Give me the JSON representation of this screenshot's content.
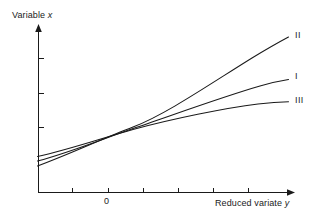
{
  "figure": {
    "background_color": "#ffffff",
    "ink_color": "#1a1a1a",
    "width": 317,
    "height": 219
  },
  "axes": {
    "y_title_prefix": "Variable ",
    "y_title_symbol": "x",
    "x_title_prefix": "Reduced variate ",
    "x_title_symbol": "y",
    "x_tick_labels": [
      "0"
    ],
    "y_tick_labels": []
  },
  "curve_labels": {
    "upper": "II",
    "middle": "I",
    "lower": "III"
  },
  "chart_data": {
    "type": "line",
    "title": "",
    "xlabel": "Reduced variate y",
    "ylabel": "Variable x",
    "grid": false,
    "legend": "inline-right-end-labels",
    "xlim": [
      -2,
      6
    ],
    "ylim": [
      0,
      1
    ],
    "x_ticks": [
      -1,
      0,
      1,
      2,
      3,
      4
    ],
    "x_tick_labels": [
      "",
      "0",
      "",
      "",
      "",
      ""
    ],
    "y_ticks": [
      0.42,
      0.63,
      0.84
    ],
    "y_tick_labels": [
      "",
      "",
      ""
    ],
    "annotations": [
      {
        "text": "II",
        "x": 6.0,
        "y": 0.925,
        "note": "upper convex curve end label"
      },
      {
        "text": "I",
        "x": 6.0,
        "y": 0.67,
        "note": "middle near-linear curve end label"
      },
      {
        "text": "III",
        "x": 6.0,
        "y": 0.535,
        "note": "lower concave curve end label"
      }
    ],
    "series": [
      {
        "name": "II",
        "shape": "convex-upward",
        "x": [
          -1.85,
          -1.3,
          -0.75,
          -0.2,
          0.35,
          0.9,
          1.45,
          2.0,
          2.6,
          3.2,
          3.8,
          4.4,
          5.0,
          5.6,
          5.85
        ],
        "y": [
          0.155,
          0.215,
          0.275,
          0.34,
          0.41,
          0.475,
          0.54,
          0.605,
          0.675,
          0.745,
          0.81,
          0.865,
          0.915,
          0.955,
          0.975
        ]
      },
      {
        "name": "I",
        "shape": "near-linear",
        "x": [
          -1.85,
          -1.3,
          -0.75,
          -0.2,
          0.35,
          0.9,
          1.45,
          2.0,
          2.6,
          3.2,
          3.8,
          4.4,
          5.0,
          5.6,
          5.85
        ],
        "y": [
          0.185,
          0.235,
          0.285,
          0.335,
          0.39,
          0.44,
          0.487,
          0.53,
          0.575,
          0.615,
          0.652,
          0.685,
          0.713,
          0.737,
          0.746
        ]
      },
      {
        "name": "III",
        "shape": "concave-flattening",
        "x": [
          -1.85,
          -1.3,
          -0.75,
          -0.2,
          0.35,
          0.9,
          1.45,
          2.0,
          2.6,
          3.2,
          3.8,
          4.4,
          5.0,
          5.6,
          5.85
        ],
        "y": [
          0.21,
          0.255,
          0.3,
          0.345,
          0.388,
          0.428,
          0.464,
          0.496,
          0.528,
          0.553,
          0.573,
          0.588,
          0.598,
          0.604,
          0.606
        ]
      }
    ]
  },
  "geometry": {
    "x_axis": {
      "x1": 38,
      "y1": 192,
      "x2": 292,
      "y2": 192
    },
    "y_axis": {
      "x1": 38,
      "y1": 192,
      "x2": 38,
      "y2": 26
    },
    "x_tick_positions": [
      72,
      108,
      143,
      178,
      213,
      248
    ],
    "y_tick_positions": [
      58,
      93,
      127
    ],
    "curve_paths": {
      "II": "M 37.5,166 C 70,154 104,138 133,127 C 165,115 210,84 252,58 C 270,47 281,41 288.5,37",
      "I": "M 37.5,161 C 70,152.5 104,138.5 133,128.5 C 170,116 225,96 260,86 C 272,82.5 282,80.5 288.5,79.5",
      "III": "M 37.5,156.5 C 70,149.5 104,137.5 133,129.5 C 172,119 225,108 258,104 C 272,102.5 282,102 288.5,101.8"
    }
  }
}
